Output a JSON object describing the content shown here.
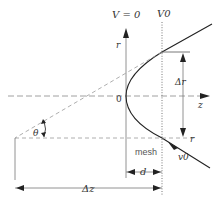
{
  "diagram": {
    "labels": {
      "v_zero": "V = 0",
      "v0_top": "V0",
      "r_axis": "r",
      "z_axis": "z",
      "origin": "0",
      "delta_r": "Δr",
      "r_offset": "r",
      "mesh": "mesh",
      "v0_vel": "v0",
      "theta": "θ",
      "d": "d",
      "delta_z": "Δz"
    },
    "colors": {
      "line": "#333333",
      "dashed": "#999999",
      "dotted": "#666666"
    }
  }
}
